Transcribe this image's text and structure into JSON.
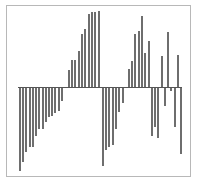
{
  "chart_data": {
    "type": "bar",
    "title": "",
    "xlabel": "",
    "ylabel": "",
    "grid": false,
    "legend": null,
    "baseline": 0,
    "ylim": [
      -83,
      76
    ],
    "bar_color": "#6e6e6e",
    "frame_color": "#b8b8b8",
    "x": [
      19,
      22,
      25,
      29,
      32,
      35,
      38,
      42,
      45,
      48,
      51,
      54,
      58,
      61,
      68,
      71,
      74,
      78,
      81,
      84,
      88,
      91,
      94,
      98,
      102,
      105,
      108,
      112,
      115,
      118,
      122,
      128,
      131,
      134,
      138,
      141,
      144,
      148,
      151,
      154,
      157,
      161,
      164,
      167,
      170,
      174,
      177,
      180
    ],
    "values": [
      -83,
      -74,
      -64,
      -59,
      -59,
      -48,
      -41,
      -41,
      -34,
      -29,
      -28,
      -25,
      -23,
      -13,
      17,
      27,
      27,
      36,
      53,
      58,
      73,
      75,
      75,
      76,
      -78,
      -62,
      -59,
      -57,
      -41,
      -24,
      -15,
      18,
      26,
      53,
      56,
      71,
      34,
      46,
      -48,
      -39,
      -50,
      31,
      -18,
      55,
      -3,
      -39,
      32,
      -66
    ]
  }
}
